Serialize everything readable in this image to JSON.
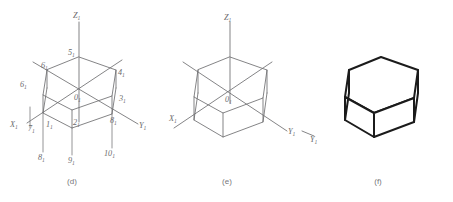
{
  "figure": {
    "panels": [
      {
        "id": "d",
        "caption": "(d)",
        "axes": [
          {
            "name": "z-axis",
            "label": "Z",
            "sub": "1"
          },
          {
            "name": "x-axis",
            "label": "X",
            "sub": "1"
          },
          {
            "name": "y-axis",
            "label": "Y",
            "sub": "1"
          }
        ],
        "vertices": [
          {
            "name": "origin",
            "label": "0",
            "sub": "1"
          },
          {
            "name": "point-1",
            "label": "1",
            "sub": "1"
          },
          {
            "name": "point-2",
            "label": "2",
            "sub": "1"
          },
          {
            "name": "point-3",
            "label": "3",
            "sub": "1"
          },
          {
            "name": "point-4",
            "label": "4",
            "sub": "1"
          },
          {
            "name": "point-5",
            "label": "5",
            "sub": "1"
          },
          {
            "name": "point-6",
            "label": "6",
            "sub": "1"
          },
          {
            "name": "point-6b",
            "label": "6",
            "sub": "1"
          },
          {
            "name": "point-7",
            "label": "7",
            "sub": "1"
          },
          {
            "name": "point-8",
            "label": "8",
            "sub": "1"
          },
          {
            "name": "point-8b",
            "label": "8",
            "sub": "1"
          },
          {
            "name": "point-9",
            "label": "9",
            "sub": "1"
          },
          {
            "name": "point-10",
            "label": "10",
            "sub": "1"
          }
        ]
      },
      {
        "id": "e",
        "caption": "(e)",
        "axes": [
          {
            "name": "z-axis",
            "label": "Z",
            "sub": "1"
          },
          {
            "name": "x-axis",
            "label": "X",
            "sub": "1"
          },
          {
            "name": "y-axis",
            "label": "Y",
            "sub": "1"
          }
        ],
        "vertices": [
          {
            "name": "origin",
            "label": "0",
            "sub": "1"
          }
        ]
      },
      {
        "id": "f",
        "caption": "(f)",
        "axes": [
          {
            "name": "y-axis",
            "label": "Y",
            "sub": "1"
          }
        ],
        "vertices": []
      }
    ]
  },
  "colors": {
    "thin_stroke": "#6e6e70",
    "bold_stroke": "#1b1b1b",
    "label_text": "#6a6a6c",
    "caption_text": "#76767a",
    "background": "#ffffff"
  }
}
